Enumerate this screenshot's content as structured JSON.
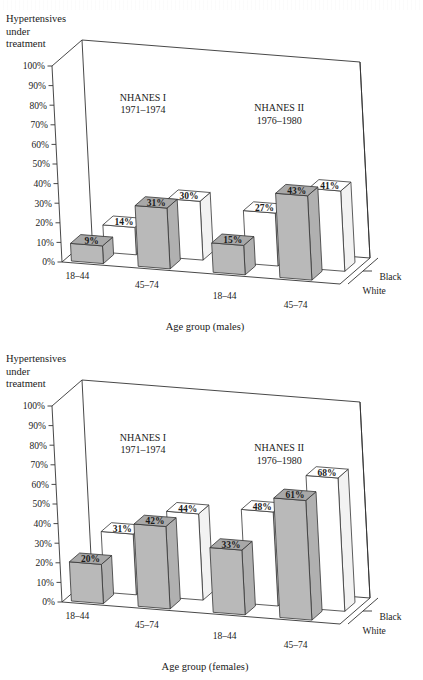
{
  "figure": {
    "background": "#ffffff",
    "line_color": "#333333",
    "bar_fill_black": "#b9b9b9",
    "bar_fill_white": "#ffffff",
    "bar_top_black": "#a8a8a8",
    "bar_side_black": "#b0b0b0",
    "bar_side_white": "#f2f2f2"
  },
  "charts": [
    {
      "id": "males",
      "y_axis_title_lines": [
        "Hypertensives",
        "under",
        "treatment"
      ],
      "y_ticks": [
        "100%",
        "90%",
        "80%",
        "70%",
        "60%",
        "50%",
        "40%",
        "30%",
        "20%",
        "10%",
        "0%"
      ],
      "x_title": "Age group (males)",
      "survey_headers": [
        {
          "name": "NHANES I",
          "years": "1971–1974"
        },
        {
          "name": "NHANES II",
          "years": "1976–1980"
        }
      ],
      "category_labels": [
        "18–44",
        "45–74",
        "18–44",
        "45–74"
      ],
      "legend": [
        "Black",
        "White"
      ],
      "bars_front": [
        "9%",
        "31%",
        "15%",
        "43%"
      ],
      "bars_back": [
        "14%",
        "30%",
        "27%",
        "41%"
      ]
    },
    {
      "id": "females",
      "y_axis_title_lines": [
        "Hypertensives",
        "under",
        "treatment"
      ],
      "y_ticks": [
        "100%",
        "90%",
        "80%",
        "70%",
        "60%",
        "50%",
        "40%",
        "30%",
        "20%",
        "10%",
        "0%"
      ],
      "x_title": "Age group (females)",
      "survey_headers": [
        {
          "name": "NHANES I",
          "years": "1971–1974"
        },
        {
          "name": "NHANES II",
          "years": "1976–1980"
        }
      ],
      "category_labels": [
        "18–44",
        "45–74",
        "18–44",
        "45–74"
      ],
      "legend": [
        "Black",
        "White"
      ],
      "bars_front": [
        "20%",
        "42%",
        "33%",
        "61%"
      ],
      "bars_back": [
        "31%",
        "44%",
        "48%",
        "68%"
      ]
    }
  ],
  "chart_data": [
    {
      "type": "bar",
      "title": "Hypertensives under treatment — males",
      "subtitle": "NHANES I (1971–1974) vs NHANES II (1976–1980)",
      "xlabel": "Age group (males)",
      "ylabel": "Hypertensives under treatment",
      "ylim": [
        0,
        100
      ],
      "grid": false,
      "legend_position": "right",
      "projection": "3d-isometric",
      "categories": [
        "NHANES I 18–44",
        "NHANES I 45–74",
        "NHANES II 18–44",
        "NHANES II 45–74"
      ],
      "tick_labels": [
        "0%",
        "10%",
        "20%",
        "30%",
        "40%",
        "50%",
        "60%",
        "70%",
        "80%",
        "90%",
        "100%"
      ],
      "series": [
        {
          "name": "Black",
          "values": [
            9,
            31,
            15,
            43
          ],
          "labels": [
            "9%",
            "31%",
            "15%",
            "43%"
          ],
          "color": "#b9b9b9"
        },
        {
          "name": "White",
          "values": [
            14,
            30,
            27,
            41
          ],
          "labels": [
            "14%",
            "30%",
            "27%",
            "41%"
          ],
          "color": "#ffffff"
        }
      ]
    },
    {
      "type": "bar",
      "title": "Hypertensives under treatment — females",
      "subtitle": "NHANES I (1971–1974) vs NHANES II (1976–1980)",
      "xlabel": "Age group (females)",
      "ylabel": "Hypertensives under treatment",
      "ylim": [
        0,
        100
      ],
      "grid": false,
      "legend_position": "right",
      "projection": "3d-isometric",
      "categories": [
        "NHANES I 18–44",
        "NHANES I 45–74",
        "NHANES II 18–44",
        "NHANES II 45–74"
      ],
      "tick_labels": [
        "0%",
        "10%",
        "20%",
        "30%",
        "40%",
        "50%",
        "60%",
        "70%",
        "80%",
        "90%",
        "100%"
      ],
      "series": [
        {
          "name": "Black",
          "values": [
            20,
            42,
            33,
            61
          ],
          "labels": [
            "20%",
            "42%",
            "33%",
            "61%"
          ],
          "color": "#b9b9b9"
        },
        {
          "name": "White",
          "values": [
            31,
            44,
            48,
            68
          ],
          "labels": [
            "31%",
            "44%",
            "48%",
            "68%"
          ],
          "color": "#ffffff"
        }
      ]
    }
  ]
}
